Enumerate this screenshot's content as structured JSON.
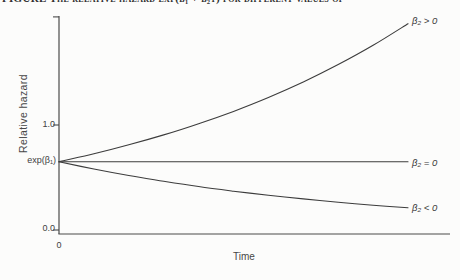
{
  "page": {
    "caption_clipped": "FIGURE  The relative hazard exp(β₁ + β₂t) for different values of the coefficient β₂"
  },
  "chart_data": {
    "type": "line",
    "title": "",
    "xlabel": "Time",
    "ylabel": "Relative hazard",
    "origin_tick_label": "0",
    "baseline_annotation": {
      "label": "exp(β₁)",
      "value": 0.65
    },
    "xlim": [
      0,
      10
    ],
    "ylim": [
      0,
      2.03
    ],
    "grid": false,
    "legend_position": "right-of-curves",
    "x": [
      0,
      1,
      2,
      3,
      4,
      5,
      6,
      7,
      8,
      9,
      10
    ],
    "series": [
      {
        "name": "beta2-positive",
        "label": "β₂ > 0",
        "values": [
          0.65,
          0.726,
          0.811,
          0.906,
          1.012,
          1.13,
          1.262,
          1.41,
          1.575,
          1.759,
          1.965
        ]
      },
      {
        "name": "beta2-zero",
        "label": "β₂ = 0",
        "values": [
          0.65,
          0.65,
          0.65,
          0.65,
          0.65,
          0.65,
          0.65,
          0.65,
          0.65,
          0.65,
          0.65
        ]
      },
      {
        "name": "beta2-negative",
        "label": "β₂ < 0",
        "values": [
          0.65,
          0.581,
          0.519,
          0.464,
          0.414,
          0.37,
          0.331,
          0.296,
          0.264,
          0.236,
          0.211
        ]
      }
    ],
    "yticks": [
      {
        "value": 0,
        "label": "0.0"
      },
      {
        "value": 1,
        "label": "1.0"
      },
      {
        "value": 2.03,
        "label": ""
      }
    ],
    "xticks": [
      {
        "value": 0,
        "label": "0"
      }
    ],
    "line_color": "#3c3c3c",
    "axis_color": "#4a4a4a",
    "text_color": "#3f3f3f",
    "background": "#fcfcfb"
  }
}
